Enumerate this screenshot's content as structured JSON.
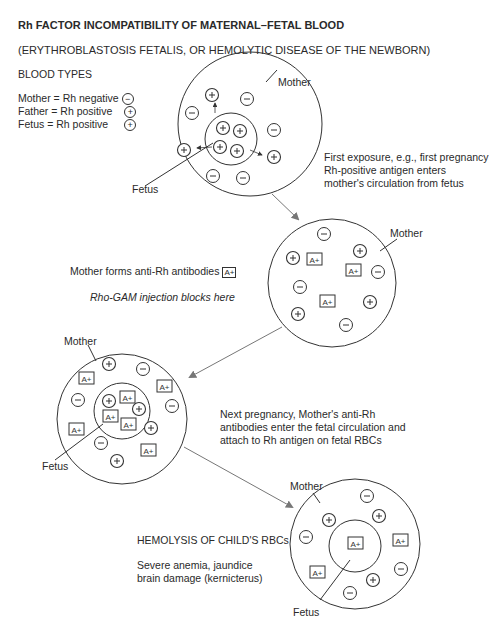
{
  "header": {
    "title": "Rh FACTOR INCOMPATIBILITY OF MATERNAL–FETAL BLOOD",
    "subtitle": "(ERYTHROBLASTOSIS FETALIS, OR HEMOLYTIC DISEASE OF THE NEWBORN)"
  },
  "legend": {
    "heading": "BLOOD TYPES",
    "items": [
      {
        "label": "Mother = Rh negative",
        "symbol": "−"
      },
      {
        "label": "Father = Rh positive",
        "symbol": "+"
      },
      {
        "label": "Fetus = Rh positive",
        "symbol": "+"
      }
    ]
  },
  "antibody_label": "A+",
  "panels": [
    {
      "id": "first-exposure",
      "mother_label": "Mother",
      "fetus_label": "Fetus",
      "caption": [
        "First exposure, e.g., first pregnancy",
        "Rh-positive antigen enters",
        "mother's circulation from fetus"
      ]
    },
    {
      "id": "antibody-formation",
      "mother_label": "Mother",
      "caption": [
        "Mother forms anti-Rh antibodies"
      ],
      "note": "Rho-GAM injection blocks here"
    },
    {
      "id": "next-pregnancy",
      "mother_label": "Mother",
      "fetus_label": "Fetus",
      "caption": [
        "Next pregnancy, Mother's anti-Rh",
        "antibodies enter the fetal circulation and",
        "attach to Rh antigen on fetal RBCs"
      ]
    },
    {
      "id": "hemolysis",
      "mother_label": "Mother",
      "fetus_label": "Fetus",
      "caption_title": "HEMOLYSIS OF CHILD'S RBCs",
      "caption": [
        "Severe anemia, jaundice",
        "brain damage (kernicterus)"
      ]
    }
  ],
  "colors": {
    "ink": "#333333",
    "arrow": "#777777",
    "text": "#2a2a2a"
  }
}
